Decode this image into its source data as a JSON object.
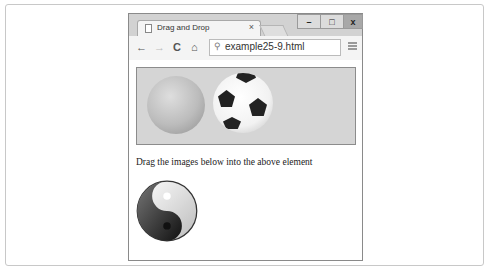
{
  "browser": {
    "tab": {
      "title": "Drag and Drop",
      "close_glyph": "×"
    },
    "window_controls": {
      "minimize": "–",
      "maximize": "□",
      "close": "x"
    },
    "toolbar": {
      "back_glyph": "←",
      "forward_glyph": "→",
      "reload_glyph": "C",
      "home_glyph": "⌂"
    },
    "address_bar": {
      "search_glyph": "⚲",
      "value": "example25-9.html"
    }
  },
  "page": {
    "drop_zone": {
      "images": [
        "orange",
        "soccer-ball"
      ]
    },
    "instruction": "Drag the images below into the above element",
    "draggable_images": [
      "yin-yang"
    ]
  }
}
